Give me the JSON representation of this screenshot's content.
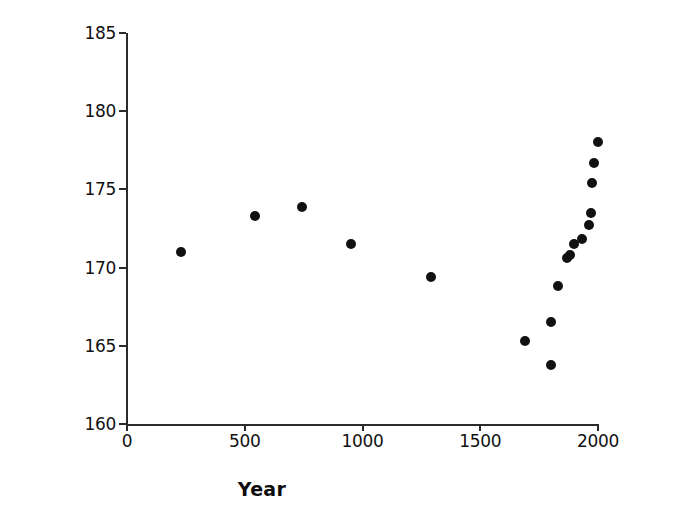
{
  "chart_data": {
    "type": "scatter",
    "title": "",
    "xlabel": "Year",
    "ylabel": "Stature (cm)",
    "xlim": [
      0,
      2000
    ],
    "ylim": [
      160,
      185
    ],
    "xticks": [
      0,
      500,
      1000,
      1500,
      2000
    ],
    "yticks": [
      160,
      165,
      170,
      175,
      180,
      185
    ],
    "xtick_labels": [
      "0",
      "500",
      "1000",
      "1500",
      "2000"
    ],
    "ytick_labels": [
      "160",
      "165",
      "170",
      "175",
      "180",
      "185"
    ],
    "grid": false,
    "legend": false,
    "marker": "filled-circle",
    "marker_color": "#111111",
    "x": [
      230,
      545,
      745,
      950,
      1290,
      1690,
      1800,
      1800,
      1830,
      1870,
      1880,
      1900,
      1930,
      1960,
      1970,
      1975,
      1985,
      2000
    ],
    "y": [
      171.0,
      173.3,
      173.9,
      171.5,
      169.4,
      165.3,
      163.8,
      166.5,
      168.8,
      170.6,
      170.8,
      171.5,
      171.8,
      172.7,
      173.5,
      175.4,
      176.7,
      178.0
    ],
    "points": [
      {
        "year": 230,
        "stature": 171.0
      },
      {
        "year": 545,
        "stature": 173.3
      },
      {
        "year": 745,
        "stature": 173.9
      },
      {
        "year": 950,
        "stature": 171.5
      },
      {
        "year": 1290,
        "stature": 169.4
      },
      {
        "year": 1690,
        "stature": 165.3
      },
      {
        "year": 1800,
        "stature": 163.8
      },
      {
        "year": 1800,
        "stature": 166.5
      },
      {
        "year": 1830,
        "stature": 168.8
      },
      {
        "year": 1870,
        "stature": 170.6
      },
      {
        "year": 1880,
        "stature": 170.8
      },
      {
        "year": 1900,
        "stature": 171.5
      },
      {
        "year": 1930,
        "stature": 171.8
      },
      {
        "year": 1960,
        "stature": 172.7
      },
      {
        "year": 1970,
        "stature": 173.5
      },
      {
        "year": 1975,
        "stature": 175.4
      },
      {
        "year": 1985,
        "stature": 176.7
      },
      {
        "year": 2000,
        "stature": 178.0
      }
    ]
  }
}
